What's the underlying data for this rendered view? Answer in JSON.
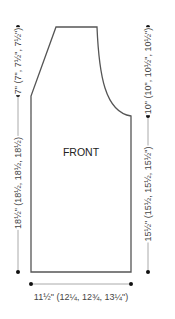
{
  "diagram": {
    "piece_label": "FRONT",
    "measurements": {
      "shoulder_depth": "7\" (7\", 7½\", 7½\")",
      "side_length": "18½\" (18½, 18½, 18½)",
      "armhole_depth": "10\" (10\", 10½\", 10½\")",
      "lower_right_length": "15½\" (15½, 15½, 15½\")",
      "width": "11½\" (12¼, 12¾, 13¼\")"
    },
    "colors": {
      "outline": "#555555",
      "dimension_line": "#999999",
      "dot": "#111111"
    }
  }
}
